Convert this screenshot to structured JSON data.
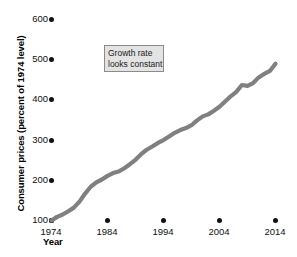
{
  "chart_data": {
    "type": "line",
    "title": "",
    "xlabel": "Year",
    "ylabel": "Consumer prices (percent of 1974 level)",
    "xlim": [
      1974,
      2014
    ],
    "ylim": [
      100,
      600
    ],
    "grid": false,
    "legend": null,
    "line_color": "#808080",
    "annotations": [
      {
        "text_lines": [
          "Growth rate",
          "looks constant"
        ],
        "x": 1983,
        "y": 520
      }
    ],
    "yticks": [
      100,
      200,
      300,
      400,
      500,
      600
    ],
    "ytick_labels": [
      "100",
      "200",
      "300",
      "400",
      "500",
      "600"
    ],
    "xticks": [
      1974,
      1984,
      1994,
      2004,
      2014
    ],
    "xtick_labels": [
      "1974",
      "1984",
      "1994",
      "2004",
      "2014"
    ],
    "series": [
      {
        "name": "Consumer price index",
        "x": [
          1974,
          1975,
          1976,
          1977,
          1978,
          1979,
          1980,
          1981,
          1982,
          1983,
          1984,
          1985,
          1986,
          1987,
          1988,
          1989,
          1990,
          1991,
          1992,
          1993,
          1994,
          1995,
          1996,
          1997,
          1998,
          1999,
          2000,
          2001,
          2002,
          2003,
          2004,
          2005,
          2006,
          2007,
          2008,
          2009,
          2010,
          2011,
          2012,
          2013,
          2014
        ],
        "values": [
          100,
          109,
          115,
          123,
          132,
          147,
          167,
          184,
          195,
          202,
          211,
          218,
          222,
          230,
          240,
          251,
          265,
          276,
          284,
          293,
          300,
          309,
          318,
          325,
          330,
          337,
          349,
          359,
          364,
          373,
          383,
          396,
          409,
          420,
          437,
          435,
          442,
          456,
          465,
          472,
          490
        ]
      }
    ]
  },
  "axes": {
    "y_title": "Consumer prices (percent of 1974 level)",
    "x_title": "Year"
  }
}
